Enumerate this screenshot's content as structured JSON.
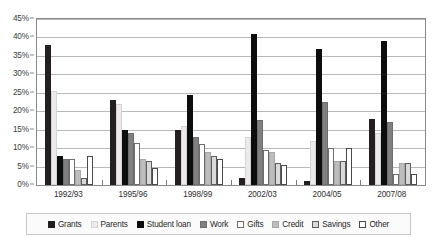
{
  "chart_data": {
    "type": "bar",
    "title": "",
    "subtitle": "",
    "xlabel": "",
    "ylabel": "",
    "ylim": [
      0,
      45
    ],
    "ytick_labels": [
      "0%",
      "5%",
      "10%",
      "15%",
      "20%",
      "25%",
      "30%",
      "35%",
      "40%",
      "45%"
    ],
    "ytick_values": [
      0,
      5,
      10,
      15,
      20,
      25,
      30,
      35,
      40,
      45
    ],
    "grid": true,
    "legend_position": "bottom",
    "categories": [
      "1992/93",
      "1995/96",
      "1998/99",
      "2002/03",
      "2004/05",
      "2007/08"
    ],
    "series": [
      {
        "name": "Grants",
        "color": "#231f20",
        "border": "#231f20",
        "values": [
          38,
          23,
          15,
          2,
          1,
          18
        ]
      },
      {
        "name": "Parents",
        "color": "#ebebeb",
        "border": "#d4d4d4",
        "values": [
          25.5,
          22,
          16,
          13,
          12,
          14
        ]
      },
      {
        "name": "Student loan",
        "color": "#0d0d0d",
        "border": "#0d0d0d",
        "values": [
          8,
          15,
          24.5,
          41,
          37,
          39
        ]
      },
      {
        "name": "Work",
        "color": "#808080",
        "border": "#6e6e6e",
        "values": [
          7,
          14,
          13,
          17.5,
          22.5,
          17
        ]
      },
      {
        "name": "Gifts",
        "color": "#ffffff",
        "border": "#6e6e6e",
        "values": [
          7,
          11.5,
          11,
          9.5,
          10,
          3
        ]
      },
      {
        "name": "Credit",
        "color": "#bdbdbd",
        "border": "#a8a8a8",
        "values": [
          4,
          7,
          9,
          9,
          6.5,
          6
        ]
      },
      {
        "name": "Savings",
        "color": "#d9d9d9",
        "border": "#5e5e5e",
        "values": [
          2,
          6.5,
          8,
          6,
          6.5,
          6
        ]
      },
      {
        "name": "Other",
        "color": "#ffffff",
        "border": "#4a4a4a",
        "values": [
          8,
          4.5,
          7,
          5.5,
          10,
          3
        ]
      }
    ]
  },
  "legend": {
    "items": [
      {
        "label": "Grants"
      },
      {
        "label": "Parents"
      },
      {
        "label": "Student loan"
      },
      {
        "label": "Work"
      },
      {
        "label": "Gifts"
      },
      {
        "label": "Credit"
      },
      {
        "label": "Savings"
      },
      {
        "label": "Other"
      }
    ]
  }
}
